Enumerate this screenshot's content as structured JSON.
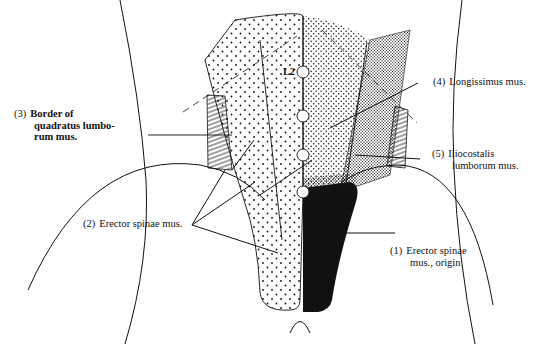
{
  "diagram": {
    "vertebra_label": "L2",
    "labels": [
      {
        "num": "(1)",
        "line1": "Erector spinae",
        "line2": "mus., origin"
      },
      {
        "num": "(2)",
        "line1": "Erector spinae mus.",
        "line2": ""
      },
      {
        "num": "(3)",
        "line1": "Border of",
        "line2": "quadratus lumbo-",
        "line3": "rum mus."
      },
      {
        "num": "(4)",
        "line1": "Longissimus mus.",
        "line2": ""
      },
      {
        "num": "(5)",
        "line1": "Iliocostalis",
        "line2": "lumborum mus."
      }
    ],
    "colors": {
      "ink": "#111111",
      "background": "#ffffff"
    }
  }
}
